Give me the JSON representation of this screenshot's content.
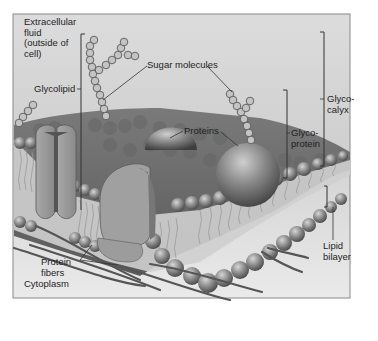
{
  "figure": {
    "frame": {
      "x": 13,
      "y": 14,
      "width": 337,
      "height": 284
    },
    "colors": {
      "background_top": "#d9d9d9",
      "background_bottom": "#e9e9e9",
      "frame_border": "#8a8a8a",
      "membrane_top": "#6e6e6e",
      "phosphate_head": "#8c8c8c",
      "protein": "#9a9a9a",
      "protein_dark": "#6a6a6a",
      "fiber": "#555555",
      "sugar": "#bdbdbd",
      "text": "#1e1e1e",
      "leader_line": "#333333"
    }
  },
  "labels": {
    "extracellular": "Extracellular\nfluid\n(outside of\ncell)",
    "glycolipid": "Glycolipid",
    "sugar_molecules": "Sugar molecules",
    "proteins": "Proteins",
    "glycoprotein": "Glyco-\nprotein",
    "glycocalyx": "Glyco-\ncalyx",
    "protein_fibers": "Protein\nfibers",
    "lipid_bilayer": "Lipid\nbilayer",
    "cytoplasm": "Cytoplasm"
  }
}
